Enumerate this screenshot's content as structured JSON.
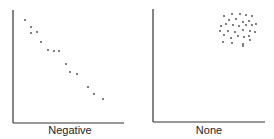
{
  "chart_data": [
    {
      "type": "scatter",
      "title": "Negative",
      "xlabel": "",
      "ylabel": "",
      "grid": false,
      "points_px": [
        [
          25,
          20
        ],
        [
          31,
          27
        ],
        [
          31,
          33
        ],
        [
          37,
          32
        ],
        [
          41,
          42
        ],
        [
          48,
          50
        ],
        [
          54,
          51
        ],
        [
          59,
          51
        ],
        [
          66,
          64
        ],
        [
          70,
          72
        ],
        [
          77,
          74
        ],
        [
          88,
          87
        ],
        [
          94,
          94
        ],
        [
          103,
          99
        ]
      ],
      "note": "Points descend from upper-left to lower-right (negative correlation)"
    },
    {
      "type": "scatter",
      "title": "None",
      "xlabel": "",
      "ylabel": "",
      "grid": false,
      "points_px": [
        [
          224,
          16
        ],
        [
          232,
          14
        ],
        [
          240,
          14
        ],
        [
          246,
          15
        ],
        [
          252,
          16
        ],
        [
          229,
          20
        ],
        [
          236,
          19
        ],
        [
          243,
          22
        ],
        [
          249,
          21
        ],
        [
          221,
          26
        ],
        [
          226,
          24
        ],
        [
          233,
          25
        ],
        [
          239,
          26
        ],
        [
          246,
          25
        ],
        [
          252,
          25
        ],
        [
          256,
          24
        ],
        [
          220,
          31
        ],
        [
          228,
          31
        ],
        [
          235,
          32
        ],
        [
          243,
          30
        ],
        [
          250,
          31
        ],
        [
          255,
          32
        ],
        [
          224,
          35
        ],
        [
          231,
          38
        ],
        [
          238,
          36
        ],
        [
          244,
          37
        ],
        [
          249,
          36
        ],
        [
          232,
          43
        ],
        [
          243,
          44
        ],
        [
          250,
          40
        ],
        [
          223,
          42
        ],
        [
          243,
          46
        ]
      ],
      "note": "Points form a random cluster in upper-right (no correlation)"
    }
  ],
  "labels": {
    "left": "Negative",
    "right": "None"
  },
  "colors": {
    "axis": "#333333",
    "dot": "#444444"
  }
}
